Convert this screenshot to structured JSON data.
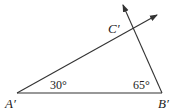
{
  "diagram": {
    "type": "triangle-construction",
    "points": {
      "A": {
        "label": "A′",
        "x": 17,
        "y": 93
      },
      "B": {
        "label": "B′",
        "x": 162,
        "y": 93
      },
      "C": {
        "label": "C′",
        "x": 133,
        "y": 29
      }
    },
    "angles": {
      "at_A": "30°",
      "at_B": "65°"
    },
    "rays": [
      {
        "from": "A′",
        "direction": "upper-right",
        "arrow": true
      },
      {
        "from": "B′",
        "direction": "upper-left",
        "arrow": true
      }
    ],
    "stroke_color": "#333333"
  }
}
